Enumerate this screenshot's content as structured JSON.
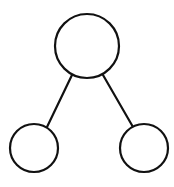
{
  "diagram": {
    "type": "tree",
    "stroke_color": "#111111",
    "fill_color": "#ffffff",
    "stroke_width": 2.2,
    "nodes": [
      {
        "id": "root",
        "cx": 87,
        "cy": 46,
        "r": 32
      },
      {
        "id": "left-child",
        "cx": 34,
        "cy": 148,
        "r": 24
      },
      {
        "id": "right-child",
        "cx": 144,
        "cy": 148,
        "r": 24
      }
    ],
    "edges": [
      {
        "from": "root",
        "to": "left-child",
        "x1": 72,
        "y1": 75,
        "x2": 47,
        "y2": 127
      },
      {
        "from": "root",
        "to": "right-child",
        "x1": 103,
        "y1": 75,
        "x2": 133,
        "y2": 127
      }
    ]
  }
}
